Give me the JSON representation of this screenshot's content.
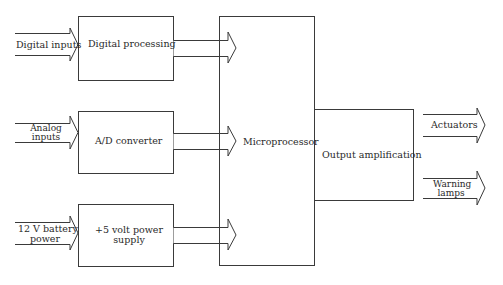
{
  "diagram": {
    "type": "block-diagram",
    "blocks": {
      "digital_processing": "Digital processing",
      "ad_converter": "A/D converter",
      "power_supply_line1": "+5 volt power",
      "power_supply_line2": "supply",
      "microprocessor": "Microprocessor",
      "output_amplification": "Output amplification"
    },
    "inputs": {
      "digital": "Digital inputs",
      "analog_line1": "Analog",
      "analog_line2": "inputs",
      "battery_line1": "12 V battery",
      "battery_line2": "power"
    },
    "outputs": {
      "actuators": "Actuators",
      "warning_line1": "Warning",
      "warning_line2": "lamps"
    },
    "colors": {
      "line": "#3a3a3a",
      "background": "#ffffff"
    }
  }
}
